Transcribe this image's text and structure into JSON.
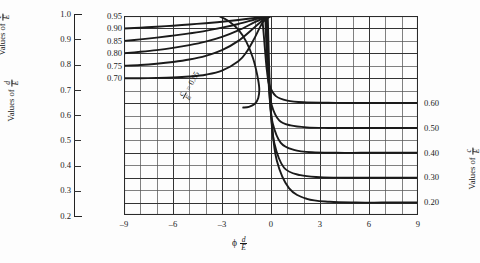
{
  "figure": {
    "background": "#fdfdfd",
    "ink_color": "#1a1a1a",
    "grid_color": "#4a4a4a"
  },
  "left_scale": {
    "title_prefix": "Values of",
    "numerator": "d",
    "denominator": "E",
    "ticks": [
      "1.0",
      "0.9",
      "0.8",
      "0.7",
      "0.6",
      "0.5",
      "0.4",
      "0.3",
      "0.2"
    ],
    "min": 0.2,
    "max": 1.0
  },
  "left_ce_axis": {
    "title_prefix": "Values of",
    "numerator": "c",
    "denominator": "E",
    "ticks": [
      "0.95",
      "0.90",
      "0.85",
      "0.80",
      "0.75",
      "0.70"
    ]
  },
  "right_ce_axis": {
    "title_prefix": "Values of",
    "numerator": "c",
    "denominator": "E",
    "ticks": [
      "0.60",
      "0.50",
      "0.40",
      "0.30",
      "0.20"
    ]
  },
  "x_axis": {
    "symbol": "ϕ",
    "numerator": "d",
    "denominator": "E",
    "ticks": [
      "-9",
      "-6",
      "-3",
      "0",
      "3",
      "6",
      "9"
    ],
    "min": -9,
    "max": 9
  },
  "annotation": {
    "label": "= 0.65",
    "numerator": "c",
    "denominator": "E"
  },
  "chart_data": {
    "type": "line",
    "title": "",
    "xlabel": "ϕ d/E",
    "ylabel": "Values of c/E",
    "xlim": [
      -9,
      9
    ],
    "ylim_upper": [
      0.65,
      0.95
    ],
    "ylim_lower": [
      0.15,
      0.65
    ],
    "grid": true,
    "grid_x_step": 1,
    "grid_y_step": 0.05,
    "legend": "none",
    "series": [
      {
        "name": "c/E = 0.90",
        "family": "upper",
        "left_edge_value": 0.9,
        "converge_value": 0.95,
        "x": [
          -9,
          -8,
          -7,
          -6,
          -5,
          -4,
          -3,
          -2,
          -1,
          -0.4,
          0
        ],
        "y": [
          0.9,
          0.903,
          0.907,
          0.911,
          0.916,
          0.921,
          0.927,
          0.934,
          0.942,
          0.948,
          0.95
        ]
      },
      {
        "name": "c/E = 0.85",
        "family": "upper",
        "left_edge_value": 0.85,
        "converge_value": 0.95,
        "x": [
          -9,
          -8,
          -7,
          -6,
          -5,
          -4,
          -3,
          -2,
          -1,
          -0.4,
          0
        ],
        "y": [
          0.85,
          0.856,
          0.863,
          0.871,
          0.88,
          0.89,
          0.903,
          0.918,
          0.936,
          0.946,
          0.95
        ]
      },
      {
        "name": "c/E = 0.80",
        "family": "upper",
        "left_edge_value": 0.8,
        "converge_value": 0.95,
        "x": [
          -9,
          -8,
          -7,
          -6,
          -5,
          -4,
          -3,
          -2,
          -1,
          -0.4,
          0
        ],
        "y": [
          0.8,
          0.806,
          0.813,
          0.822,
          0.833,
          0.847,
          0.866,
          0.892,
          0.925,
          0.943,
          0.95
        ]
      },
      {
        "name": "c/E = 0.75",
        "family": "upper",
        "left_edge_value": 0.75,
        "converge_value": 0.95,
        "x": [
          -9,
          -8,
          -7,
          -6,
          -5,
          -4,
          -3,
          -2,
          -1,
          -0.4,
          0
        ],
        "y": [
          0.75,
          0.753,
          0.758,
          0.765,
          0.775,
          0.79,
          0.813,
          0.85,
          0.905,
          0.938,
          0.95
        ]
      },
      {
        "name": "c/E = 0.70",
        "family": "upper",
        "left_edge_value": 0.7,
        "converge_value": 0.95,
        "x": [
          -9,
          -8,
          -7,
          -6,
          -5,
          -4,
          -3,
          -2,
          -1.5,
          -1,
          -0.5,
          0
        ],
        "y": [
          0.7,
          0.7,
          0.701,
          0.703,
          0.707,
          0.714,
          0.73,
          0.768,
          0.805,
          0.862,
          0.925,
          0.95
        ]
      },
      {
        "name": "c/E = 0.65",
        "family": "hook",
        "right_asymptote": 0.65,
        "x": [
          -3.2,
          -2.6,
          -2.0,
          -1.5,
          -1.1,
          -0.85,
          -0.72,
          -0.78,
          -1.0,
          -1.35,
          -1.7
        ],
        "y": [
          0.95,
          0.93,
          0.895,
          0.845,
          0.78,
          0.715,
          0.66,
          0.62,
          0.596,
          0.585,
          0.582
        ]
      },
      {
        "name": "c/E = 0.60",
        "family": "lower",
        "right_asymptote": 0.6,
        "x": [
          -0.55,
          -0.45,
          -0.35,
          -0.25,
          -0.1,
          0.3,
          1,
          2,
          3.5,
          5,
          7,
          9
        ],
        "y": [
          0.95,
          0.88,
          0.8,
          0.73,
          0.672,
          0.628,
          0.61,
          0.603,
          0.601,
          0.6,
          0.6,
          0.6
        ]
      },
      {
        "name": "c/E = 0.50",
        "family": "lower",
        "right_asymptote": 0.5,
        "x": [
          -0.35,
          -0.3,
          -0.22,
          -0.12,
          0.05,
          0.5,
          1.2,
          2.2,
          3.5,
          5,
          7,
          9
        ],
        "y": [
          0.95,
          0.86,
          0.76,
          0.67,
          0.59,
          0.53,
          0.51,
          0.502,
          0.5,
          0.5,
          0.5,
          0.5
        ]
      },
      {
        "name": "c/E = 0.40",
        "family": "lower",
        "right_asymptote": 0.4,
        "x": [
          -0.3,
          -0.25,
          -0.18,
          -0.08,
          0.1,
          0.6,
          1.4,
          2.5,
          4,
          5.5,
          7.5,
          9
        ],
        "y": [
          0.95,
          0.85,
          0.73,
          0.62,
          0.52,
          0.44,
          0.412,
          0.402,
          0.4,
          0.4,
          0.4,
          0.4
        ]
      },
      {
        "name": "c/E = 0.30",
        "family": "lower",
        "right_asymptote": 0.3,
        "x": [
          -0.25,
          -0.2,
          -0.13,
          -0.02,
          0.2,
          0.8,
          1.8,
          3,
          4.5,
          6,
          7.5,
          9
        ],
        "y": [
          0.95,
          0.84,
          0.7,
          0.57,
          0.44,
          0.34,
          0.31,
          0.302,
          0.3,
          0.3,
          0.3,
          0.3
        ]
      },
      {
        "name": "c/E = 0.20",
        "family": "lower",
        "right_asymptote": 0.2,
        "x": [
          -0.2,
          -0.15,
          -0.08,
          0.05,
          0.35,
          1.1,
          2.2,
          3.6,
          5.2,
          6.8,
          8,
          9
        ],
        "y": [
          0.95,
          0.83,
          0.68,
          0.52,
          0.37,
          0.258,
          0.215,
          0.203,
          0.2,
          0.2,
          0.2,
          0.2
        ]
      }
    ]
  }
}
